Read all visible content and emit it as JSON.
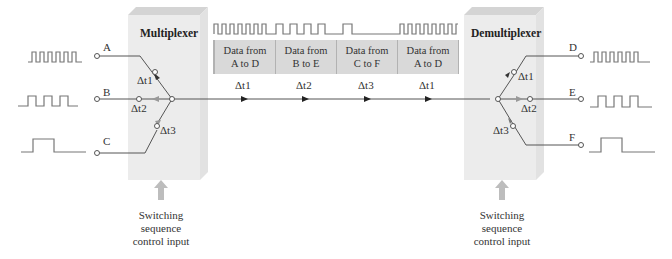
{
  "multiplexer": {
    "title": "Multiplexer",
    "inputs": [
      {
        "label": "A",
        "signal": "high-frequency square wave"
      },
      {
        "label": "B",
        "signal": "medium-frequency square wave"
      },
      {
        "label": "C",
        "signal": "single pulse"
      }
    ],
    "switch_labels": [
      "Δt1",
      "Δt2",
      "Δt3"
    ],
    "control_caption": [
      "Switching",
      "sequence",
      "control input"
    ]
  },
  "demultiplexer": {
    "title": "Demultiplexer",
    "outputs": [
      {
        "label": "D",
        "signal": "high-frequency square wave"
      },
      {
        "label": "E",
        "signal": "medium-frequency square wave"
      },
      {
        "label": "F",
        "signal": "single pulse"
      }
    ],
    "switch_labels": [
      "Δt1",
      "Δt2",
      "Δt3"
    ],
    "control_caption": [
      "Switching",
      "sequence",
      "control input"
    ]
  },
  "channel": {
    "slots": [
      {
        "line1": "Data from",
        "line2": "A to D",
        "interval": "Δt1"
      },
      {
        "line1": "Data from",
        "line2": "B to E",
        "interval": "Δt2"
      },
      {
        "line1": "Data from",
        "line2": "C to F",
        "interval": "Δt3"
      },
      {
        "line1": "Data from",
        "line2": "A to D",
        "interval": "Δt1"
      }
    ],
    "arrow_labels": [
      "Δt1",
      "Δt2",
      "Δt3",
      "Δt1"
    ]
  },
  "colors": {
    "box_fill": "#e9e9e9",
    "box_top": "#cfcfcf",
    "slot_fill": "#d9d9d9",
    "wire": "#555555",
    "signal": "#777777",
    "arrow": "#bdbdbd"
  }
}
